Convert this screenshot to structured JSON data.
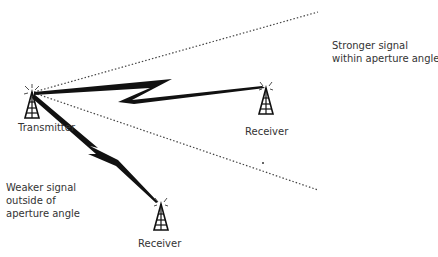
{
  "nodes": {
    "transmitter": {
      "label": "Transmitter"
    },
    "receiver_near": {
      "label": "Receiver"
    },
    "receiver_far": {
      "label": "Receiver"
    }
  },
  "annotations": {
    "stronger": {
      "line1": "Stronger signal",
      "line2": "within aperture angle"
    },
    "weaker": {
      "line1": "Weaker signal",
      "line2": "outside of",
      "line3": "aperture angle"
    }
  },
  "colors": {
    "ink": "#111111",
    "text": "#333333",
    "dotted": "#444444"
  }
}
